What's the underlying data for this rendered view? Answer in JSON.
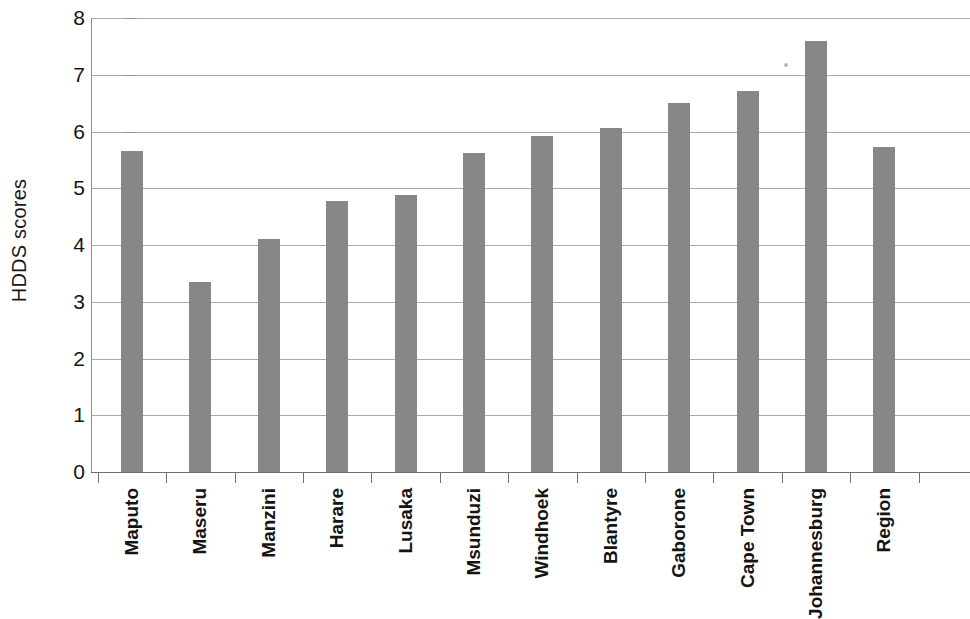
{
  "chart_data": {
    "type": "bar",
    "title": "",
    "xlabel": "",
    "ylabel": "HDDS scores",
    "ylim": [
      0,
      8
    ],
    "ytick_step": 1,
    "ytick_labels": [
      "8",
      "7",
      "6",
      "5",
      "4",
      "3",
      "2",
      "1",
      "0"
    ],
    "grid": true,
    "legend": false,
    "bar_color": "#878787",
    "axis_color": "#6f6f6f",
    "categories": [
      "Maputo",
      "Maseru",
      "Manzini",
      "Harare",
      "Lusaka",
      "Msunduzi",
      "Windhoek",
      "Blantyre",
      "Gaborone",
      "Cape Town",
      "Johannesburg",
      "Region"
    ],
    "values": [
      5.65,
      3.35,
      4.1,
      4.78,
      4.88,
      5.62,
      5.92,
      6.06,
      6.5,
      6.72,
      7.6,
      5.73
    ]
  }
}
